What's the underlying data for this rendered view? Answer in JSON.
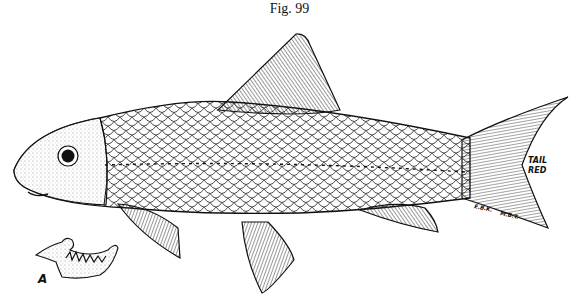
{
  "figure": {
    "title": "Fig. 99",
    "tail_note_line1": "TAIL",
    "tail_note_line2": "RED",
    "artist_initials_1": "E.B.K.",
    "artist_initials_2": "M.B.T.",
    "inset_label": "A"
  },
  "colors": {
    "ink": "#111111",
    "paper": "#ffffff"
  }
}
